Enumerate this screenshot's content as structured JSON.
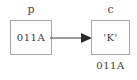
{
  "diagram": {
    "type": "pointer-memory-diagram",
    "background_color": "#ffffff",
    "box_border_color": "#a8a8a8",
    "text_color": "#3c3c3c",
    "label_color": "#4a4a4a",
    "arrow_color": "#3a3a3a",
    "pointer_variable": {
      "name": "p",
      "stored_value": "011A"
    },
    "target_variable": {
      "name": "c",
      "stored_value": "'K'",
      "address": "011A"
    },
    "arrow": {
      "icon": "arrow-right-icon",
      "from": "p",
      "to": "c"
    }
  }
}
